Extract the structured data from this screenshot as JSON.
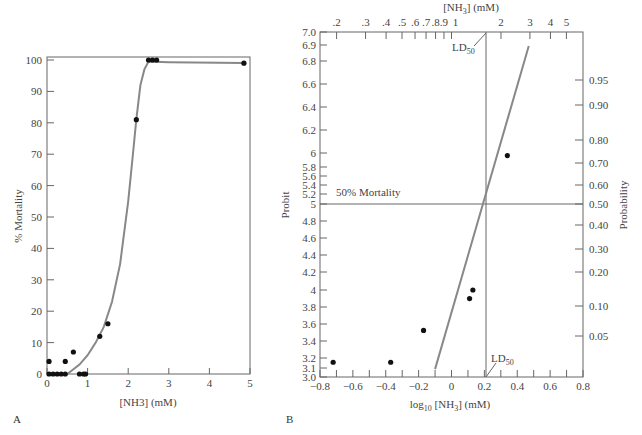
{
  "panels": {
    "a": {
      "label": "A",
      "xlabel": "[NH3] (mM)",
      "ylabel": "% Mortality"
    },
    "b": {
      "label": "B",
      "xlabel": "log10 [NH3] (mM)",
      "top_xlabel": "[NH3] (mM)",
      "ylabel": "Probit",
      "right_ylabel": "Probability",
      "annotation_50": "50% Mortality",
      "ld50_label": "LD50"
    }
  },
  "chart_data": [
    {
      "type": "scatter",
      "title": "",
      "panel": "A",
      "xlabel": "[NH3] (mM)",
      "ylabel": "% Mortality",
      "xlim": [
        0,
        5
      ],
      "ylim": [
        0,
        100
      ],
      "xticks": [
        0,
        1,
        2,
        3,
        4,
        5
      ],
      "yticks": [
        0,
        10,
        20,
        30,
        40,
        50,
        60,
        70,
        80,
        90,
        100
      ],
      "grid": false,
      "series": [
        {
          "name": "observed",
          "x": [
            0.05,
            0.05,
            0.15,
            0.25,
            0.35,
            0.45,
            0.45,
            0.65,
            0.8,
            0.9,
            0.95,
            1.3,
            1.5,
            2.2,
            2.5,
            2.6,
            2.7,
            4.85
          ],
          "y": [
            4,
            0,
            0,
            0,
            0,
            4,
            0,
            7,
            0,
            0,
            0,
            12,
            16,
            81,
            100,
            100,
            100,
            99
          ]
        },
        {
          "name": "fitted curve",
          "style": "line",
          "x": [
            0.5,
            0.8,
            1.0,
            1.2,
            1.4,
            1.6,
            1.8,
            2.0,
            2.1,
            2.2,
            2.3,
            2.4,
            2.5,
            3.0,
            4.85
          ],
          "y": [
            0,
            3,
            6,
            10,
            15,
            23,
            35,
            55,
            68,
            81,
            92,
            97,
            99.5,
            99.3,
            99
          ]
        }
      ]
    },
    {
      "type": "scatter",
      "title": "",
      "panel": "B",
      "xlabel": "log10 [NH3] (mM)",
      "ylabel": "Probit",
      "top_xlabel": "[NH3] (mM)",
      "right_ylabel": "Probability",
      "xlim": [
        -0.8,
        0.8
      ],
      "ylim": [
        3.0,
        7.0
      ],
      "xticks": [
        -0.8,
        -0.6,
        -0.4,
        -0.2,
        0,
        0.2,
        0.4,
        0.6,
        0.8
      ],
      "yticks": [
        "7.0",
        "6.9",
        "6.8",
        "6.6",
        "6.4",
        "6.2",
        "6",
        "5.8",
        "5.6",
        "5.4",
        "5.2",
        "5",
        "4.8",
        "4.6",
        "4.4",
        "4.2",
        "4",
        "3.8",
        "3.6",
        "3.4",
        "3.2",
        "3.1",
        "3.0"
      ],
      "top_xticks": [
        ".2",
        ".3",
        ".4",
        ".5",
        ".6",
        ".7",
        ".8",
        ".9",
        "1",
        "2",
        "3",
        "4",
        "5"
      ],
      "right_yticks": [
        "0.95",
        "0.90",
        "0.80",
        "0.70",
        "0.60",
        "0.50",
        "0.40",
        "0.30",
        "0.20",
        "0.10",
        "0.05"
      ],
      "grid": false,
      "series": [
        {
          "name": "observed",
          "x": [
            -0.72,
            -0.37,
            -0.17,
            0.11,
            0.13,
            0.34
          ],
          "y": [
            3.16,
            3.16,
            3.53,
            3.9,
            4.0,
            5.95
          ]
        },
        {
          "name": "probit regression",
          "style": "line",
          "x": [
            -0.1,
            0.47
          ],
          "y": [
            3.08,
            6.62
          ]
        }
      ],
      "annotations": [
        {
          "text": "50% Mortality",
          "y": 5
        },
        {
          "text": "LD50",
          "x": 0.22
        }
      ]
    }
  ]
}
